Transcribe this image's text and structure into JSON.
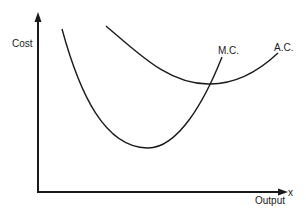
{
  "diagram": {
    "y_axis_label": "Cost",
    "x_axis_label": "Output",
    "x_axis_symbol": "x",
    "curves": [
      {
        "name": "marginal-cost",
        "label": "M.C."
      },
      {
        "name": "average-cost",
        "label": "A.C."
      }
    ],
    "colors": {
      "line": "#1a1a1a",
      "background": "#ffffff"
    }
  }
}
